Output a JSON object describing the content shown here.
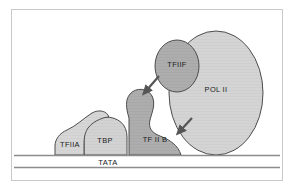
{
  "figure": {
    "title_visible": false,
    "frame_color": "#c9c9c9",
    "background": "#ffffff"
  },
  "diagram": {
    "type": "biological-schematic",
    "dna": {
      "label": "TATA",
      "line_color": "#8c8c8c",
      "strand_count": 2
    },
    "factors": [
      {
        "id": "tfiia",
        "label": "TFIIA",
        "fill": "#d6d6d6",
        "stroke": "#4d4d4d"
      },
      {
        "id": "tbp",
        "label": "TBP",
        "fill": "#d2d2d2",
        "stroke": "#4d4d4d"
      },
      {
        "id": "tfiib",
        "label": "TF II B",
        "fill": "#adadad",
        "stroke": "#4d4d4d"
      },
      {
        "id": "tfiif",
        "label": "TFIIF",
        "fill": "#a8a8a8",
        "stroke": "#4d4d4d"
      },
      {
        "id": "polii",
        "label": "POL II",
        "fill": "#d4d4d4",
        "stroke": "#4d4d4d"
      }
    ],
    "arrows": [
      {
        "id": "arrow-tfiif-recruit",
        "direction": "down-left",
        "color": "#555555"
      },
      {
        "id": "arrow-polii-recruit",
        "direction": "down-left",
        "color": "#555555"
      }
    ]
  }
}
